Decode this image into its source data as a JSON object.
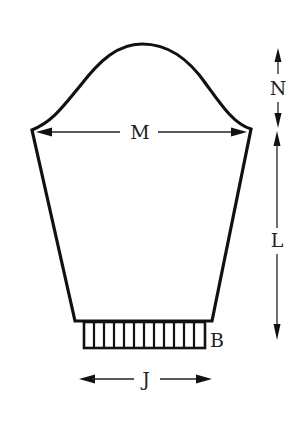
{
  "diagram": {
    "type": "sleeve-schematic",
    "labels": {
      "cap_height": "N",
      "upper_arm_width": "M",
      "sleeve_length": "L",
      "cuff": "B",
      "cuff_width": "J"
    },
    "colors": {
      "line": "#111111",
      "background": "#ffffff"
    },
    "cuff_rib_count": 12
  }
}
